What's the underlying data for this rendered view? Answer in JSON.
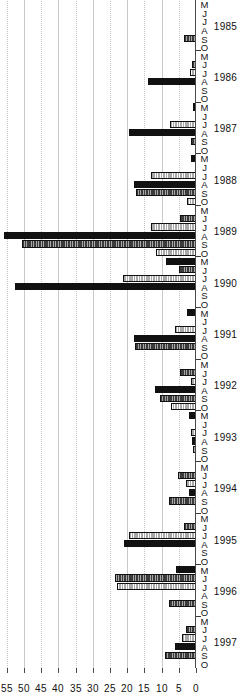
{
  "chart_data": {
    "type": "bar",
    "title": "",
    "subtitle": "",
    "xlabel": "",
    "ylabel": "",
    "orientation": "horizontal-rotated",
    "grid": true,
    "legend_position": "none",
    "ylim": [
      0,
      57
    ],
    "value_ticks": [
      0,
      5,
      10,
      15,
      20,
      25,
      30,
      35,
      40,
      45,
      50,
      55
    ],
    "value_tick_labels": [
      "0",
      "5",
      "10",
      "15",
      "20",
      "25",
      "30",
      "35",
      "40",
      "45",
      "50",
      "55"
    ],
    "months": [
      "M",
      "J",
      "J",
      "A",
      "S",
      "O"
    ],
    "years": [
      "1985",
      "1986",
      "1987",
      "1988",
      "1989",
      "1990",
      "1991",
      "1992",
      "1993",
      "1994",
      "1995",
      "1996",
      "1997"
    ],
    "series": [
      {
        "name": "series-1",
        "style": "black",
        "color": "#111111"
      },
      {
        "name": "series-2",
        "style": "dark-hatch",
        "color": "#3b3b3b"
      },
      {
        "name": "series-3",
        "style": "light-hatch",
        "color": "#d2d2d2"
      }
    ],
    "categories": [
      "1985-M",
      "1985-J",
      "1985-J",
      "1985-A",
      "1985-S",
      "1985-O",
      "1986-M",
      "1986-J",
      "1986-J",
      "1986-A",
      "1986-S",
      "1986-O",
      "1987-M",
      "1987-J",
      "1987-J",
      "1987-A",
      "1987-S",
      "1987-O",
      "1988-M",
      "1988-J",
      "1988-J",
      "1988-A",
      "1988-S",
      "1988-O",
      "1989-M",
      "1989-J",
      "1989-J",
      "1989-A",
      "1989-S",
      "1989-O",
      "1990-M",
      "1990-J",
      "1990-J",
      "1990-A",
      "1990-S",
      "1990-O",
      "1991-M",
      "1991-J",
      "1991-J",
      "1991-A",
      "1991-S",
      "1991-O",
      "1992-M",
      "1992-J",
      "1992-J",
      "1992-A",
      "1992-S",
      "1992-O",
      "1993-M",
      "1993-J",
      "1993-J",
      "1993-A",
      "1993-S",
      "1993-O",
      "1994-M",
      "1994-J",
      "1994-J",
      "1994-A",
      "1994-S",
      "1994-O",
      "1995-M",
      "1995-J",
      "1995-J",
      "1995-A",
      "1995-S",
      "1995-O",
      "1996-M",
      "1996-J",
      "1996-J",
      "1996-A",
      "1996-S",
      "1996-O",
      "1997-M",
      "1997-J",
      "1997-J",
      "1997-A",
      "1997-S",
      "1997-O"
    ],
    "values": [
      0,
      0,
      0,
      0,
      3.6,
      0,
      0,
      1.2,
      1.8,
      14.0,
      0,
      0,
      0.8,
      0,
      7.5,
      19.5,
      1.5,
      0,
      1.6,
      0,
      13.2,
      18.0,
      17.5,
      2.6,
      0,
      4.8,
      13.0,
      55.8,
      50.6,
      11.5,
      8.6,
      5.0,
      21.2,
      52.5,
      0,
      0,
      2.5,
      0,
      6.0,
      18.0,
      17.6,
      0,
      0,
      4.6,
      1.4,
      12.0,
      10.6,
      7.4,
      2.0,
      0,
      1.6,
      1.2,
      0.8,
      0,
      0,
      5.2,
      3.0,
      2.0,
      8.0,
      0,
      0,
      3.5,
      19.5,
      21.0,
      0,
      0,
      5.8,
      23.5,
      23.0,
      0,
      7.8,
      0,
      0,
      3.0,
      4.2,
      6.2,
      9.0,
      0
    ]
  }
}
